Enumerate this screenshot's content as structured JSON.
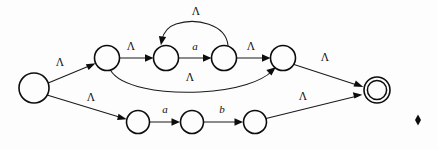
{
  "figure": {
    "kind": "nfa-state-diagram",
    "width": 438,
    "height": 150,
    "background_color": "#fdfdfd",
    "stroke_color": "#0d0d0d",
    "label_color": "#111111"
  },
  "states": [
    {
      "id": "q0",
      "name": "start-state",
      "cx": 34,
      "cy": 88,
      "r": 15,
      "accepting": false,
      "label": ""
    },
    {
      "id": "q1",
      "name": "upper-branch-entry",
      "cx": 107,
      "cy": 58,
      "r": 12.5,
      "accepting": false,
      "label": ""
    },
    {
      "id": "q2",
      "name": "loop-entry-state",
      "cx": 166,
      "cy": 58,
      "r": 12.5,
      "accepting": false,
      "label": ""
    },
    {
      "id": "q3",
      "name": "loop-exit-state",
      "cx": 224,
      "cy": 58,
      "r": 12.5,
      "accepting": false,
      "label": ""
    },
    {
      "id": "q4",
      "name": "upper-branch-join",
      "cx": 283,
      "cy": 58,
      "r": 12.5,
      "accepting": false,
      "label": ""
    },
    {
      "id": "q5",
      "name": "lower-branch-entry",
      "cx": 138,
      "cy": 122,
      "r": 11.5,
      "accepting": false,
      "label": ""
    },
    {
      "id": "q6",
      "name": "lower-middle-state",
      "cx": 192,
      "cy": 122,
      "r": 11.5,
      "accepting": false,
      "label": ""
    },
    {
      "id": "q7",
      "name": "lower-branch-exit",
      "cx": 255,
      "cy": 122,
      "r": 11.5,
      "accepting": false,
      "label": ""
    },
    {
      "id": "q8",
      "name": "accept-state",
      "cx": 377,
      "cy": 90,
      "r": 13,
      "accepting": true,
      "label": ""
    }
  ],
  "transitions": [
    {
      "id": "t0",
      "name": "edge-start-to-upper",
      "from": "q0",
      "to": "q1",
      "label": "Λ",
      "label_x": 60,
      "label_y": 63,
      "italic": false
    },
    {
      "id": "t1",
      "name": "edge-start-to-lower",
      "from": "q0",
      "to": "q5",
      "label": "Λ",
      "label_x": 91,
      "label_y": 98,
      "italic": false
    },
    {
      "id": "t2",
      "name": "edge-upper-to-loop-entry",
      "from": "q1",
      "to": "q2",
      "label": "Λ",
      "label_x": 131,
      "label_y": 47,
      "italic": false
    },
    {
      "id": "t3",
      "name": "edge-loop-entry-to-exit",
      "from": "q2",
      "to": "q3",
      "label": "a",
      "label_x": 195,
      "label_y": 47,
      "italic": true
    },
    {
      "id": "t4",
      "name": "edge-loop-back",
      "from": "q3",
      "to": "q2",
      "label": "Λ",
      "label_x": 196,
      "label_y": 12,
      "italic": false
    },
    {
      "id": "t5",
      "name": "edge-loop-exit-to-join",
      "from": "q3",
      "to": "q4",
      "label": "Λ",
      "label_x": 251,
      "label_y": 47,
      "italic": false
    },
    {
      "id": "t6",
      "name": "edge-bypass-upper",
      "from": "q1",
      "to": "q4",
      "label": "Λ",
      "label_x": 190,
      "label_y": 78,
      "italic": false
    },
    {
      "id": "t7",
      "name": "edge-join-to-accept",
      "from": "q4",
      "to": "q8",
      "label": "Λ",
      "label_x": 325,
      "label_y": 58,
      "italic": false
    },
    {
      "id": "t8",
      "name": "edge-lower-a",
      "from": "q5",
      "to": "q6",
      "label": "a",
      "label_x": 165,
      "label_y": 110,
      "italic": true
    },
    {
      "id": "t9",
      "name": "edge-lower-b",
      "from": "q6",
      "to": "q7",
      "label": "b",
      "label_x": 222,
      "label_y": 110,
      "italic": true
    },
    {
      "id": "t10",
      "name": "edge-lower-to-accept",
      "from": "q7",
      "to": "q8",
      "label": "Λ",
      "label_x": 303,
      "label_y": 97,
      "italic": false
    }
  ],
  "decorations": [
    {
      "id": "d0",
      "name": "page-corner-marker",
      "shape": "diamond",
      "cx": 418,
      "cy": 120,
      "w": 6,
      "h": 11
    }
  ]
}
